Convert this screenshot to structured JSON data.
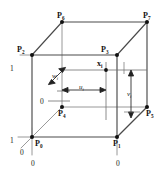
{
  "figure": {
    "type": "diagram",
    "colors": {
      "background": "#ffffff",
      "edge_front": "#4a4a4a",
      "edge_back": "#8d8d8d",
      "guide": "#6f6f6f",
      "text": "#111111",
      "vertex": "#111111"
    }
  },
  "vertices": [
    {
      "id": "P0",
      "label": "P",
      "sub": "0",
      "x": 32,
      "y": 137,
      "hidden": false
    },
    {
      "id": "P1",
      "label": "P",
      "sub": "1",
      "x": 117,
      "y": 137,
      "hidden": false
    },
    {
      "id": "P2",
      "label": "P",
      "sub": "2",
      "x": 32,
      "y": 55,
      "hidden": false
    },
    {
      "id": "P3",
      "label": "P",
      "sub": "3",
      "x": 117,
      "y": 55,
      "hidden": false
    },
    {
      "id": "P4",
      "label": "P",
      "sub": "4",
      "x": 62,
      "y": 107,
      "hidden": true
    },
    {
      "id": "P5",
      "label": "P",
      "sub": "5",
      "x": 147,
      "y": 107,
      "hidden": false
    },
    {
      "id": "P6",
      "label": "P",
      "sub": "6",
      "x": 62,
      "y": 22,
      "hidden": false
    },
    {
      "id": "P7",
      "label": "P",
      "sub": "7",
      "x": 147,
      "y": 22,
      "hidden": false
    }
  ],
  "point": {
    "id": "xi",
    "label": "x",
    "sub": "i",
    "x": 106,
    "y": 70
  },
  "parameters": [
    {
      "id": "u",
      "label": "u",
      "sub": "i",
      "text_x": 81,
      "text_y": 88,
      "direction": "horizontal"
    },
    {
      "id": "v",
      "label": "v",
      "sub": "i",
      "text_x": 131,
      "text_y": 93,
      "direction": "vertical"
    },
    {
      "id": "w",
      "label": "w",
      "sub": "i",
      "text_x": 56,
      "text_y": 74,
      "direction": "diagonal"
    }
  ],
  "axis_ticks": [
    {
      "id": "tick-v-1",
      "value": "1",
      "x": 12,
      "y": 68,
      "axis": "v"
    },
    {
      "id": "tick-v-0",
      "value": "0",
      "x": 42,
      "y": 101,
      "axis": "v"
    },
    {
      "id": "tick-u-1",
      "value": "1",
      "x": 12,
      "y": 140,
      "axis": "u"
    },
    {
      "id": "tick-u-0",
      "value": "0",
      "x": 119,
      "y": 163,
      "axis": "u"
    },
    {
      "id": "tick-origin-w",
      "value": "0",
      "x": 22,
      "y": 152,
      "axis": "w"
    },
    {
      "id": "tick-origin-u",
      "value": "0",
      "x": 33,
      "y": 163,
      "axis": "u"
    }
  ],
  "edges": [
    {
      "from": "P0",
      "to": "P1",
      "style": "front"
    },
    {
      "from": "P0",
      "to": "P2",
      "style": "front"
    },
    {
      "from": "P1",
      "to": "P3",
      "style": "front"
    },
    {
      "from": "P2",
      "to": "P3",
      "style": "front"
    },
    {
      "from": "P4",
      "to": "P5",
      "style": "back"
    },
    {
      "from": "P4",
      "to": "P6",
      "style": "back"
    },
    {
      "from": "P5",
      "to": "P7",
      "style": "back"
    },
    {
      "from": "P6",
      "to": "P7",
      "style": "front"
    },
    {
      "from": "P0",
      "to": "P4",
      "style": "back"
    },
    {
      "from": "P1",
      "to": "P5",
      "style": "front"
    },
    {
      "from": "P2",
      "to": "P6",
      "style": "front"
    },
    {
      "from": "P3",
      "to": "P7",
      "style": "front"
    }
  ]
}
